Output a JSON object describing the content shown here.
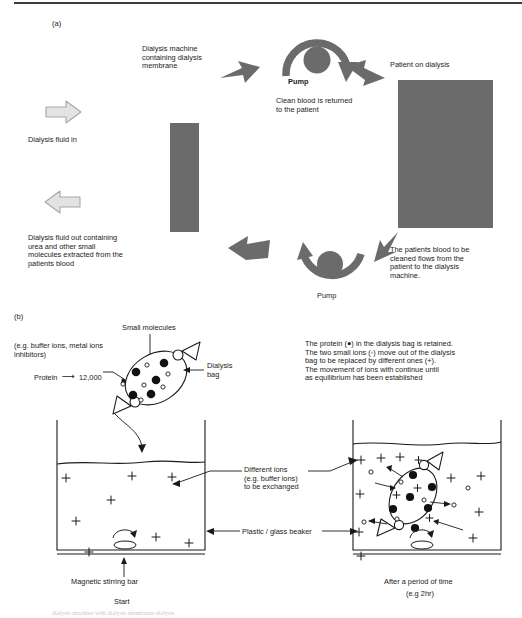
{
  "figure": {
    "panel_a_label": "(a)",
    "panel_b_label": "(b)",
    "bottom_cut_text": "dialysis machine with dialysis membrane dialysis"
  },
  "panel_a": {
    "title_machine": "Dialysis machine\ncontaining dialysis\nmembrane",
    "pump_top_label": "Pump",
    "clean_blood_text": "Clean blood is returned\nto the patient",
    "patient_label": "Patient on dialysis",
    "fluid_in_label": "Dialysis fluid in",
    "fluid_out_label": "Dialysis fluid out containing\nurea and other small\nmolecules extracted from the\npatients blood",
    "pump_bottom_label": "Pump",
    "blood_flow_text": "The patients blood to be\ncleaned flows from the\npatient to the dialysis\nmachine.",
    "colors": {
      "gray_block": "#6b6b6b",
      "dark_arrow": "#6b6b6b",
      "light_arrow_fill": "#e3e3e3",
      "light_arrow_stroke": "#a8a8a8"
    }
  },
  "panel_b": {
    "small_molecules_label": "Small molecules",
    "buffer_ions_label": "(e.g. buffer ions, metal ions\ninhibitors)",
    "protein_label": "Protein",
    "protein_arrow": "⟶",
    "protein_mw": "12,000",
    "dialysis_bag_label": "Dialysis\nbag",
    "explanation": "The protein (●) in the dialysis bag is retained.\nThe two small ions (◦) move out of the dialysis\nbag to be replaced by different ones (+).\nThe movement of ions with continue until\nas equilibrium has been established",
    "different_ions_label": "Different ions\n(e.g. buffer ions)\nto be exchanged",
    "beaker_label": "Plastic / glass beaker",
    "stirring_bar_label": "Magnetic stirring bar",
    "start_label": "Start",
    "after_label": "After a period of time",
    "after_sub_label": "(e.g 2hr)",
    "ion_symbol_plus": "+",
    "left_beaker_ions": [
      {
        "x": 62,
        "y": 478
      },
      {
        "x": 128,
        "y": 476
      },
      {
        "x": 168,
        "y": 477
      },
      {
        "x": 107,
        "y": 500
      },
      {
        "x": 72,
        "y": 521
      },
      {
        "x": 152,
        "y": 537
      },
      {
        "x": 185,
        "y": 543
      },
      {
        "x": 85,
        "y": 552
      }
    ],
    "right_beaker_plus_ions": [
      {
        "x": 360,
        "y": 462
      },
      {
        "x": 378,
        "y": 461
      },
      {
        "x": 397,
        "y": 460
      },
      {
        "x": 448,
        "y": 480
      },
      {
        "x": 478,
        "y": 478
      },
      {
        "x": 357,
        "y": 497
      },
      {
        "x": 386,
        "y": 494
      },
      {
        "x": 455,
        "y": 513
      },
      {
        "x": 356,
        "y": 533
      },
      {
        "x": 418,
        "y": 532
      },
      {
        "x": 470,
        "y": 537
      },
      {
        "x": 477,
        "y": 515
      },
      {
        "x": 358,
        "y": 556
      }
    ],
    "right_beaker_small_ions": [
      {
        "x": 372,
        "y": 474
      },
      {
        "x": 468,
        "y": 489
      },
      {
        "x": 443,
        "y": 508
      },
      {
        "x": 365,
        "y": 527
      },
      {
        "x": 392,
        "y": 526
      }
    ],
    "bag_proteins_left": [
      {
        "x": 136,
        "y": 372
      },
      {
        "x": 164,
        "y": 363
      },
      {
        "x": 156,
        "y": 380
      },
      {
        "x": 133,
        "y": 395
      },
      {
        "x": 151,
        "y": 394
      }
    ],
    "bag_small_ions_left": [
      {
        "x": 147,
        "y": 365
      },
      {
        "x": 168,
        "y": 374
      },
      {
        "x": 123,
        "y": 384
      },
      {
        "x": 144,
        "y": 385
      },
      {
        "x": 163,
        "y": 387
      },
      {
        "x": 141,
        "y": 400
      }
    ]
  },
  "icons": {
    "pump": "pump-circle-icon",
    "arrow_block": "block-arrow-icon",
    "stir_bar": "magnetic-stir-bar-icon",
    "clamp": "bag-clamp-icon"
  }
}
